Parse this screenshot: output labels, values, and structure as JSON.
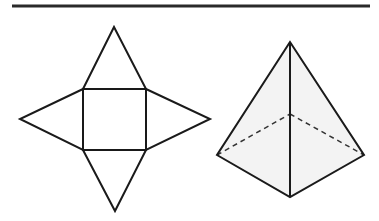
{
  "figure": {
    "colors": {
      "stroke": "#1a1a1a",
      "rule": "#2a2a2a",
      "face_fill": "#f3f3f3",
      "background": "#ffffff"
    },
    "net": {
      "square": [
        [
          83,
          89
        ],
        [
          146,
          89
        ],
        [
          146,
          150
        ],
        [
          83,
          150
        ]
      ],
      "apex_top": [
        114,
        27
      ],
      "apex_left": [
        20,
        119
      ],
      "apex_right": [
        210,
        119
      ],
      "apex_bottom": [
        115,
        211
      ]
    },
    "pyramid": {
      "apex": [
        290,
        42
      ],
      "base_left": [
        217,
        155
      ],
      "base_right": [
        364,
        155
      ],
      "base_front": [
        290,
        197
      ],
      "base_back_hidden": [
        290,
        114
      ]
    }
  }
}
